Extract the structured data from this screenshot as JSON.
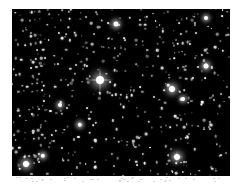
{
  "image": {
    "subject": "dense starfield",
    "background_color": "#000000",
    "page_background": "#ffffff",
    "field": {
      "x": 12,
      "y": 9,
      "width": 218,
      "height": 167
    }
  },
  "bright_stars": [
    {
      "x": 100,
      "y": 80,
      "r": 4,
      "spikes": 14
    },
    {
      "x": 172,
      "y": 89,
      "r": 3,
      "spikes": 5
    },
    {
      "x": 177,
      "y": 157,
      "r": 3,
      "spikes": 6
    },
    {
      "x": 206,
      "y": 66,
      "r": 2.5,
      "spikes": 4
    },
    {
      "x": 116,
      "y": 24,
      "r": 2.5,
      "spikes": 0
    },
    {
      "x": 26,
      "y": 164,
      "r": 3,
      "spikes": 4
    },
    {
      "x": 43,
      "y": 156,
      "r": 2.2,
      "spikes": 0
    },
    {
      "x": 80,
      "y": 125,
      "r": 2.2,
      "spikes": 0
    },
    {
      "x": 206,
      "y": 18,
      "r": 2,
      "spikes": 0
    },
    {
      "x": 183,
      "y": 99,
      "r": 2,
      "spikes": 0
    },
    {
      "x": 60,
      "y": 105,
      "r": 2,
      "spikes": 0
    }
  ],
  "faint_star_count": 520,
  "random_seed": 7
}
